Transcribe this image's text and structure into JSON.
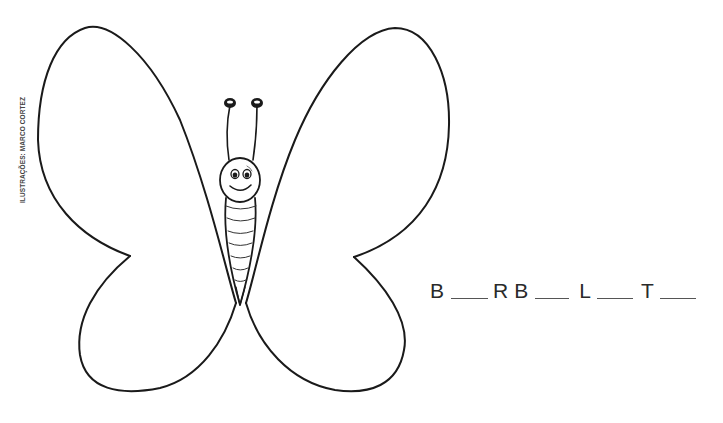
{
  "credit": "ILUSTRAÇÕES: MARCO CORTEZ",
  "illustration": {
    "subject": "butterfly-outline",
    "stroke_color": "#1a1a1a",
    "background": "#ffffff"
  },
  "puzzle": {
    "tokens": [
      {
        "type": "letter",
        "value": "B"
      },
      {
        "type": "blank",
        "width": 37
      },
      {
        "type": "letter",
        "value": "R"
      },
      {
        "type": "letter",
        "value": "B"
      },
      {
        "type": "blank",
        "width": 34
      },
      {
        "type": "letter",
        "value": "L"
      },
      {
        "type": "blank",
        "width": 36
      },
      {
        "type": "letter",
        "value": "T"
      },
      {
        "type": "blank",
        "width": 36
      }
    ],
    "letters": {
      "l0": "B",
      "l1": "R",
      "l2": "B",
      "l3": "L",
      "l4": "T"
    }
  }
}
